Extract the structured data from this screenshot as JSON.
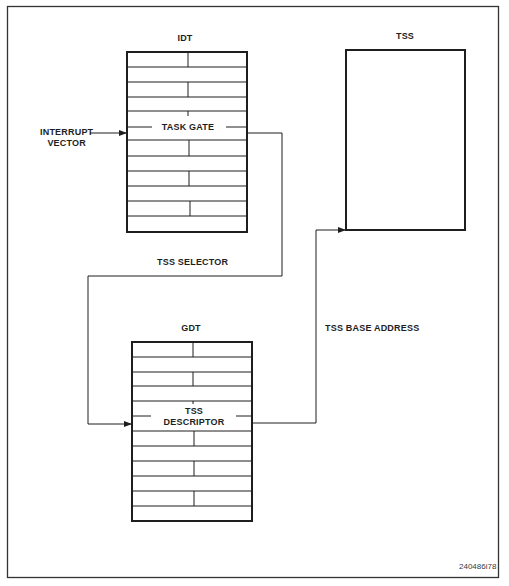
{
  "diagram": {
    "type": "block-flow",
    "nodes": {
      "idt": {
        "label": "IDT",
        "highlighted_entry": "TASK GATE"
      },
      "gdt": {
        "label": "GDT",
        "highlighted_entry_line1": "TSS",
        "highlighted_entry_line2": "DESCRIPTOR"
      },
      "tss": {
        "label": "TSS"
      }
    },
    "input": {
      "line1": "INTERRUPT",
      "line2": "VECTOR"
    },
    "edges": [
      {
        "from": "interrupt-vector",
        "to": "idt.task-gate",
        "label": ""
      },
      {
        "from": "idt.task-gate",
        "to": "gdt.tss-descriptor",
        "label": "TSS SELECTOR"
      },
      {
        "from": "gdt.tss-descriptor",
        "to": "tss",
        "label": "TSS BASE ADDRESS"
      }
    ],
    "edge_labels": {
      "selector": "TSS SELECTOR",
      "base_address": "TSS BASE ADDRESS"
    },
    "figure_id": "240486i78",
    "colors": {
      "line": "#1e1e1e",
      "background": "#ffffff"
    }
  }
}
